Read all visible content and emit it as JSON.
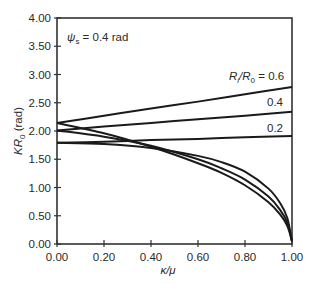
{
  "chart_data": {
    "type": "line",
    "title": "",
    "xlabel": "κ/μ",
    "ylabel": "KR0 (rad)",
    "xlim": [
      0,
      1
    ],
    "ylim": [
      0,
      4
    ],
    "grid": false,
    "x_ticks": [
      "0.00",
      "0.20",
      "0.40",
      "0.60",
      "0.80",
      "1.00"
    ],
    "y_ticks": [
      "0.00",
      "0.50",
      "1.00",
      "1.50",
      "2.00",
      "2.50",
      "3.00",
      "3.50",
      "4.00"
    ],
    "annotations": [
      {
        "text": "ψs = 0.4 rad",
        "position": "top-left"
      },
      {
        "text": "Ri/R0 = 0.6",
        "attached_to": "rising-0.6"
      },
      {
        "text": "0.4",
        "attached_to": "rising-0.4"
      },
      {
        "text": "0.2",
        "attached_to": "rising-0.2"
      }
    ],
    "series": [
      {
        "name": "Ri/R0 = 0.6 (rising)",
        "x": [
          0,
          0.2,
          0.4,
          0.6,
          0.8,
          1.0
        ],
        "y": [
          2.14,
          2.27,
          2.4,
          2.52,
          2.65,
          2.78
        ]
      },
      {
        "name": "Ri/R0 = 0.4 (rising)",
        "x": [
          0,
          0.2,
          0.4,
          0.6,
          0.8,
          1.0
        ],
        "y": [
          2.01,
          2.08,
          2.14,
          2.21,
          2.27,
          2.34
        ]
      },
      {
        "name": "Ri/R0 = 0.2 (rising)",
        "x": [
          0,
          0.2,
          0.4,
          0.6,
          0.8,
          1.0
        ],
        "y": [
          1.79,
          1.81,
          1.84,
          1.86,
          1.89,
          1.91
        ]
      },
      {
        "name": "Ri/R0 = 0.6 (falling)",
        "x": [
          0,
          0.2,
          0.4,
          0.6,
          0.7,
          0.8,
          0.9,
          0.95,
          0.98,
          1.0
        ],
        "y": [
          2.14,
          1.96,
          1.72,
          1.43,
          1.26,
          1.04,
          0.74,
          0.52,
          0.32,
          0.05
        ]
      },
      {
        "name": "Ri/R0 = 0.4 (falling)",
        "x": [
          0,
          0.2,
          0.4,
          0.6,
          0.7,
          0.8,
          0.9,
          0.95,
          0.98,
          1.0
        ],
        "y": [
          2.01,
          1.9,
          1.74,
          1.5,
          1.34,
          1.14,
          0.84,
          0.6,
          0.38,
          0.05
        ]
      },
      {
        "name": "Ri/R0 = 0.2 (falling)",
        "x": [
          0,
          0.2,
          0.4,
          0.6,
          0.7,
          0.8,
          0.9,
          0.95,
          0.98,
          1.0
        ],
        "y": [
          1.79,
          1.77,
          1.7,
          1.56,
          1.45,
          1.28,
          0.98,
          0.72,
          0.46,
          0.05
        ]
      }
    ]
  },
  "labels": {
    "psi_prefix": "ψ",
    "psi_sub": "s",
    "psi_suffix": " = 0.4 rad",
    "ratio_R1": "R",
    "ratio_i": "i",
    "ratio_R2": "/R",
    "ratio_0": "0",
    "ratio_value": " = 0.6",
    "label_04": "0.4",
    "label_02": "0.2",
    "xlabel": "κ/μ",
    "ylabel_K": "KR",
    "ylabel_0": "0",
    "ylabel_unit": " (rad)"
  }
}
